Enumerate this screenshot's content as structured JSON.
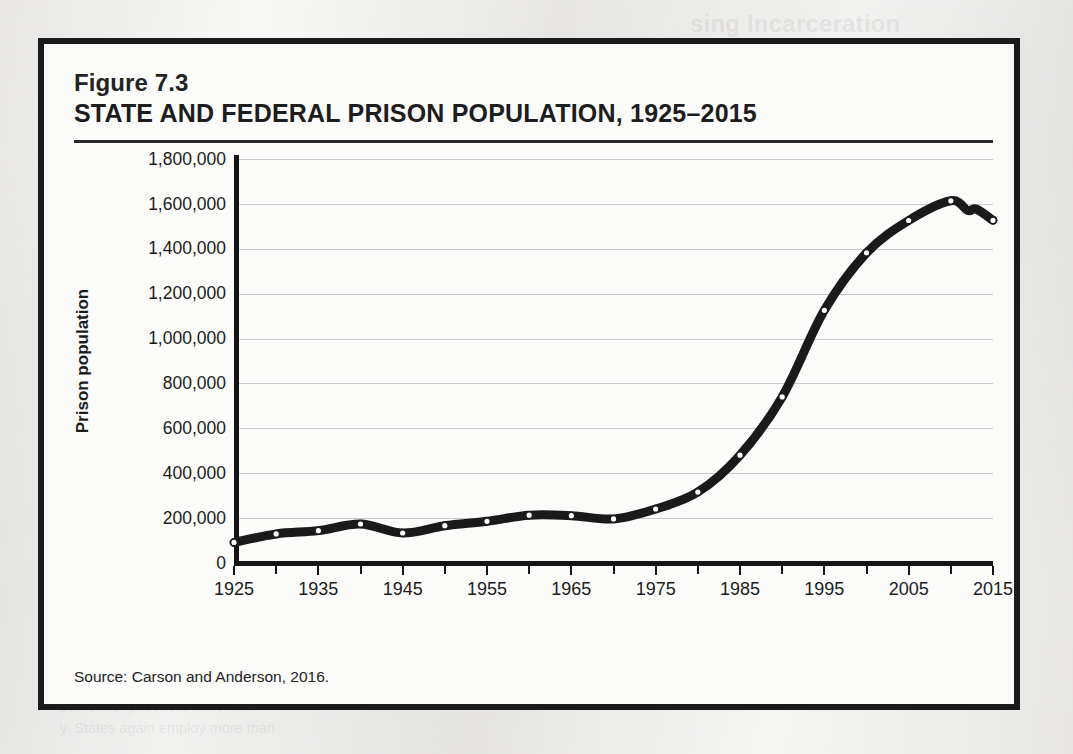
{
  "figure": {
    "number": "Figure 7.3",
    "title": "STATE AND FEDERAL PRISON POPULATION, 1925–2015",
    "source": "Source:  Carson and Anderson, 2016."
  },
  "colors": {
    "line": "#1a1a1a",
    "marker_fill": "#ffffff",
    "grid": "#c9c9c9",
    "axis": "#151515",
    "page": "#f0efed",
    "figure_bg": "#fbfbfa",
    "border": "#1b1b1b"
  },
  "page_bleed": [
    {
      "text": "sing Incarceration",
      "x": 690,
      "y": 10,
      "kind": "head"
    },
    {
      "text": "ough the 1960s, crime",
      "x": 690,
      "y": 46,
      "kind": "body"
    },
    {
      "text": "bringing ‘law and order’",
      "x": 690,
      "y": 68,
      "kind": "body"
    },
    {
      "text": "changing views on crime and how to",
      "x": 690,
      "y": 90,
      "kind": "body"
    },
    {
      "text": "nment of those in question ma",
      "x": 470,
      "y": 425,
      "kind": "body"
    },
    {
      "text": "sponse to a 2011 Supreme Court",
      "x": 60,
      "y": 486,
      "kind": "body"
    },
    {
      "text": "of the South. California was ordered",
      "x": 60,
      "y": 508,
      "kind": "body"
    },
    {
      "text": "below its 2011 level of over",
      "x": 60,
      "y": 530,
      "kind": "body"
    },
    {
      "text": "the jurisdiction. California prison",
      "x": 60,
      "y": 676,
      "kind": "body"
    },
    {
      "text": "percent of prisoners were held",
      "x": 60,
      "y": 698,
      "kind": "body"
    },
    {
      "text": "y. States again employ more than",
      "x": 60,
      "y": 720,
      "kind": "body"
    }
  ],
  "chart_data": {
    "type": "line",
    "title": "STATE AND FEDERAL PRISON POPULATION, 1925–2015",
    "xlabel": "",
    "ylabel": "Prison population",
    "xlim": [
      1925,
      2015
    ],
    "ylim": [
      0,
      1800000
    ],
    "grid": true,
    "legend": null,
    "source": "Carson and Anderson, 2016.",
    "ytick_labels": [
      "1,800,000",
      "1,600,000",
      "1,400,000",
      "1,200,000",
      "1,000,000",
      "800,000",
      "600,000",
      "400,000",
      "200,000",
      "0"
    ],
    "ytick_values": [
      1800000,
      1600000,
      1400000,
      1200000,
      1000000,
      800000,
      600000,
      400000,
      200000,
      0
    ],
    "xtick_labels": [
      "1925",
      "1935",
      "1945",
      "1955",
      "1965",
      "1975",
      "1985",
      "1995",
      "2005",
      "2015"
    ],
    "xtick_values": [
      1925,
      1935,
      1945,
      1955,
      1965,
      1975,
      1985,
      1995,
      2005,
      2015
    ],
    "x_minor_step": 5,
    "x": [
      1925,
      1930,
      1935,
      1940,
      1945,
      1950,
      1955,
      1960,
      1965,
      1970,
      1975,
      1980,
      1985,
      1990,
      1995,
      2000,
      2005,
      2010,
      2012,
      2013,
      2015
    ],
    "values": [
      91669,
      129453,
      144180,
      173706,
      133649,
      166123,
      185780,
      212953,
      210895,
      196429,
      240593,
      315974,
      480568,
      739980,
      1125874,
      1381892,
      1525924,
      1613803,
      1570397,
      1577000,
      1526800
    ],
    "series": [
      {
        "name": "State and federal prison population",
        "values": [
          91669,
          129453,
          144180,
          173706,
          133649,
          166123,
          185780,
          212953,
          210895,
          196429,
          240593,
          315974,
          480568,
          739980,
          1125874,
          1381892,
          1525924,
          1613803,
          1570397,
          1577000,
          1526800
        ]
      }
    ],
    "marker_years": [
      1925,
      1930,
      1935,
      1940,
      1945,
      1950,
      1955,
      1960,
      1965,
      1970,
      1975,
      1980,
      1985,
      1990,
      1995,
      2000,
      2005,
      2010,
      2015
    ]
  }
}
